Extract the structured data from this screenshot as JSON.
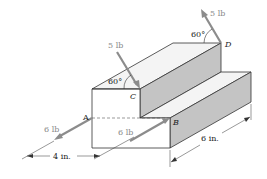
{
  "figure": {
    "points": [
      {
        "id": "A",
        "label": "A"
      },
      {
        "id": "B",
        "label": "B"
      },
      {
        "id": "C",
        "label": "C"
      },
      {
        "id": "D",
        "label": "D"
      }
    ],
    "forces": [
      {
        "at": "A",
        "label": "6 lb",
        "magnitude": 6,
        "unit": "lb"
      },
      {
        "at": "B",
        "label": "6 lb",
        "magnitude": 6,
        "unit": "lb"
      },
      {
        "at": "C",
        "label": "5 lb",
        "magnitude": 5,
        "unit": "lb",
        "angle_label": "60°"
      },
      {
        "at": "D",
        "label": "5 lb",
        "magnitude": 5,
        "unit": "lb",
        "angle_label": "60°"
      }
    ],
    "dimensions": [
      {
        "label": "4 in.",
        "value": 4,
        "unit": "in."
      },
      {
        "label": "6 in.",
        "value": 6,
        "unit": "in."
      }
    ],
    "colors": {
      "shade": "#c8c8c8",
      "shade_dark": "#bdbdbd",
      "arrow": "#8c8c8c",
      "line": "#333333"
    }
  }
}
